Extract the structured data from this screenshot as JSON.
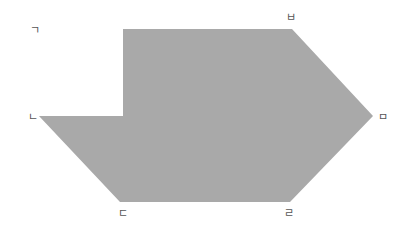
{
  "diagram": {
    "shape": {
      "fill": "#a9a9a9",
      "points": "123,29 292,29 373,116 290,202 120,202 39,116 123,116"
    },
    "labels": [
      {
        "id": "giyeok",
        "text": "ㄱ",
        "x": 30,
        "y": 34
      },
      {
        "id": "nieun",
        "text": "ㄴ",
        "x": 28,
        "y": 121
      },
      {
        "id": "digeut",
        "text": "ㄷ",
        "x": 118,
        "y": 217
      },
      {
        "id": "rieul",
        "text": "ㄹ",
        "x": 284,
        "y": 217
      },
      {
        "id": "mieum",
        "text": "ㅁ",
        "x": 378,
        "y": 121
      },
      {
        "id": "bieup",
        "text": "ㅂ",
        "x": 286,
        "y": 21
      }
    ]
  }
}
